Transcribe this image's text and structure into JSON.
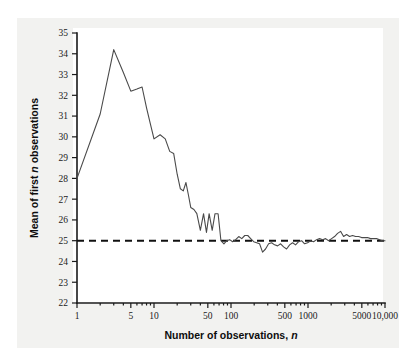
{
  "figure": {
    "background_color": "#f2f2f0",
    "plot_background_color": "#ffffff",
    "line_color": "#4a4a4a",
    "reference_line_color": "#111111"
  },
  "xaxis": {
    "title_main": "Number of observations,",
    "title_italic": "n",
    "scale": "log",
    "range": [
      1,
      10000
    ],
    "tick_labels": [
      "1",
      "5",
      "10",
      "50",
      "100",
      "500",
      "1000",
      "5000",
      "10,000"
    ]
  },
  "yaxis": {
    "title_part1": "Mean of first ",
    "title_italic": "n",
    "title_part2": " observations",
    "range": [
      22,
      35
    ],
    "tick_labels": [
      "22",
      "23",
      "24",
      "25",
      "26",
      "27",
      "28",
      "29",
      "30",
      "31",
      "32",
      "33",
      "34",
      "35"
    ]
  },
  "reference": {
    "label": "25",
    "value": 25
  },
  "chart_data": {
    "type": "line",
    "title": "",
    "subtitle": "",
    "xlabel": "Number of observations, n",
    "ylabel": "Mean of first n observations",
    "xscale": "log",
    "xlim": [
      1,
      10000
    ],
    "ylim": [
      22,
      35
    ],
    "grid": false,
    "legend": "none",
    "xticks": [
      1,
      5,
      10,
      50,
      100,
      500,
      1000,
      5000,
      10000
    ],
    "xticklabels": [
      "1",
      "5",
      "10",
      "50",
      "100",
      "500",
      "1000",
      "5000",
      "10,000"
    ],
    "yticks": [
      22,
      23,
      24,
      25,
      26,
      27,
      28,
      29,
      30,
      31,
      32,
      33,
      34,
      35
    ],
    "annotations": [
      {
        "type": "hline",
        "y": 25,
        "style": "dashed",
        "label": "population mean = 25"
      }
    ],
    "series": [
      {
        "name": "running mean",
        "x": [
          1,
          2,
          3,
          4,
          5,
          6,
          7,
          8,
          9,
          10,
          12,
          14,
          16,
          18,
          20,
          22,
          24,
          26,
          28,
          30,
          33,
          36,
          40,
          44,
          48,
          52,
          57,
          62,
          68,
          74,
          81,
          88,
          96,
          105,
          115,
          126,
          138,
          151,
          165,
          180,
          197,
          215,
          235,
          257,
          281,
          308,
          337,
          368,
          403,
          441,
          482,
          527,
          577,
          631,
          690,
          755,
          826,
          903,
          988,
          1081,
          1182,
          1293,
          1414,
          1547,
          1692,
          1851,
          2024,
          2214,
          2422,
          2649,
          2897,
          3169,
          3467,
          3792,
          4148,
          4537,
          4962,
          5428,
          5937,
          6494,
          7103,
          7769,
          8498,
          9295,
          10000
        ],
        "y": [
          28.0,
          31.1,
          34.2,
          33.1,
          32.2,
          32.3,
          32.4,
          31.4,
          30.6,
          29.9,
          30.1,
          29.9,
          29.3,
          29.2,
          28.2,
          27.5,
          27.4,
          27.8,
          27.2,
          26.6,
          26.5,
          26.3,
          25.5,
          26.3,
          25.4,
          26.3,
          25.5,
          26.3,
          26.3,
          25.0,
          24.85,
          25.0,
          25.05,
          24.95,
          25.05,
          25.2,
          25.1,
          25.25,
          25.25,
          25.1,
          24.95,
          24.9,
          24.85,
          24.45,
          24.6,
          24.85,
          24.9,
          24.8,
          24.75,
          24.85,
          24.7,
          24.6,
          24.8,
          24.9,
          24.8,
          24.95,
          25.0,
          24.85,
          24.9,
          25.0,
          24.95,
          25.05,
          25.1,
          25.05,
          25.1,
          25.0,
          25.1,
          25.2,
          25.35,
          25.45,
          25.2,
          25.3,
          25.2,
          25.25,
          25.2,
          25.2,
          25.15,
          25.15,
          25.15,
          25.1,
          25.1,
          25.1,
          25.05,
          25.0,
          25.0
        ]
      }
    ]
  }
}
